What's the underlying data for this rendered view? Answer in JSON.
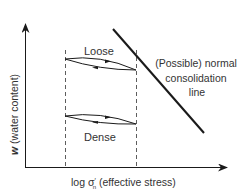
{
  "diagram": {
    "axes": {
      "y_label_var": "w",
      "y_label_rest": " (water content)",
      "x_label_prefix": "log σ",
      "x_label_sup": "′",
      "x_label_sub": "n",
      "x_label_rest": " (effective stress)"
    },
    "loops": [
      {
        "label": "Loose"
      },
      {
        "label": "Dense"
      }
    ],
    "ncl": {
      "line1": "(Possible) normal",
      "line2": "consolidation",
      "line3": "line"
    },
    "colors": {
      "ink": "#1a1a1a",
      "text": "#333333",
      "background": "#ffffff"
    }
  }
}
